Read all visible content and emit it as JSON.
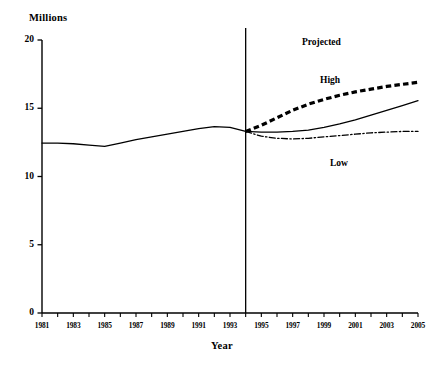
{
  "chart_data": {
    "type": "line",
    "title": "",
    "ylabel": "Millions",
    "xlabel": "Year",
    "xlim": [
      1981,
      2005
    ],
    "ylim": [
      0,
      20
    ],
    "yticks": [
      0,
      5,
      10,
      15,
      20
    ],
    "ytick_labels": [
      "0",
      "5",
      "10",
      "15",
      "20"
    ],
    "xticks": [
      1981,
      1982,
      1983,
      1984,
      1985,
      1986,
      1987,
      1988,
      1989,
      1990,
      1991,
      1992,
      1993,
      1994,
      1995,
      1996,
      1997,
      1998,
      1999,
      2000,
      2001,
      2002,
      2003,
      2004,
      2005
    ],
    "xtick_labels": [
      "1981",
      "1983",
      "1985",
      "1987",
      "1989",
      "1991",
      "1993",
      "1995",
      "1997",
      "1999",
      "2001",
      "2003",
      "2005"
    ],
    "xtick_label_years": [
      1981,
      1983,
      1985,
      1987,
      1989,
      1991,
      1993,
      1995,
      1997,
      1999,
      2001,
      2003,
      2005
    ],
    "grid": false,
    "legend": "inline-annotations",
    "annotations": [
      {
        "text": "Projected",
        "x": 1998.4,
        "y": 19.5
      },
      {
        "text": "High",
        "x": 1999.6,
        "y": 16.8
      },
      {
        "text": "Low",
        "x": 2000.3,
        "y": 10.8
      }
    ],
    "divider": {
      "x": 1994,
      "label": "projection-start"
    },
    "series": [
      {
        "name": "Historical",
        "style": "solid",
        "x": [
          1981,
          1982,
          1983,
          1984,
          1985,
          1986,
          1987,
          1988,
          1989,
          1990,
          1991,
          1992,
          1993,
          1994
        ],
        "values": [
          12.45,
          12.45,
          12.4,
          12.3,
          12.2,
          12.45,
          12.7,
          12.9,
          13.1,
          13.3,
          13.5,
          13.65,
          13.6,
          13.3
        ]
      },
      {
        "name": "High",
        "style": "dashed",
        "x": [
          1994,
          1995,
          1996,
          1997,
          1998,
          1999,
          2000,
          2001,
          2002,
          2003,
          2004,
          2005
        ],
        "values": [
          13.3,
          13.75,
          14.3,
          14.85,
          15.3,
          15.65,
          15.95,
          16.2,
          16.4,
          16.6,
          16.75,
          16.9
        ]
      },
      {
        "name": "Middle",
        "style": "solid",
        "x": [
          1994,
          1995,
          1996,
          1997,
          1998,
          1999,
          2000,
          2001,
          2002,
          2003,
          2004,
          2005
        ],
        "values": [
          13.3,
          13.25,
          13.25,
          13.3,
          13.4,
          13.6,
          13.85,
          14.15,
          14.5,
          14.85,
          15.2,
          15.55
        ]
      },
      {
        "name": "Low",
        "style": "dash-dot",
        "x": [
          1994,
          1995,
          1996,
          1997,
          1998,
          1999,
          2000,
          2001,
          2002,
          2003,
          2004,
          2005
        ],
        "values": [
          13.3,
          12.95,
          12.8,
          12.75,
          12.8,
          12.9,
          13.0,
          13.1,
          13.2,
          13.25,
          13.3,
          13.3
        ]
      }
    ],
    "colors": {
      "axis": "#000000",
      "series": "#000000",
      "background": "#ffffff"
    }
  }
}
